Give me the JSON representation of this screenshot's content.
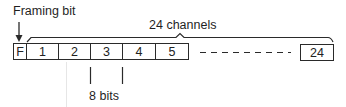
{
  "labels": {
    "framing_bit": "Framing bit",
    "channels": "24 channels",
    "bits": "8 bits"
  },
  "frame": {
    "framing_cell": "F",
    "channels": [
      "1",
      "2",
      "3",
      "4",
      "5"
    ],
    "last_channel": "24",
    "channel_count": 24,
    "bits_per_channel": 8
  },
  "colors": {
    "stroke": "#2a2a2a",
    "text": "#1f1f1f",
    "background": "#ffffff"
  }
}
